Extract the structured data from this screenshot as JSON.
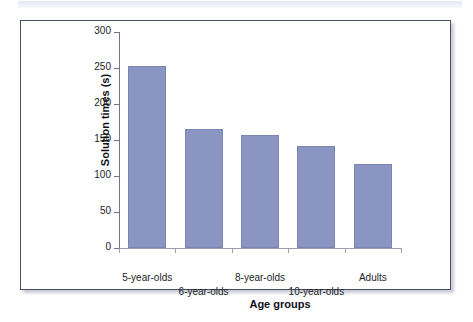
{
  "figure": {
    "background_color": "#ffffff",
    "frame_color": "#4a4f66",
    "top_strip_color": "#e3e7f1"
  },
  "chart_data": {
    "type": "bar",
    "title": "",
    "subtitle": "",
    "xlabel": "Age groups",
    "ylabel": "Solution times (s)",
    "categories": [
      "5-year-olds",
      "6-year-olds",
      "8-year-olds",
      "10-year-olds",
      "Adults"
    ],
    "values": [
      253,
      165,
      157,
      142,
      117
    ],
    "series": [
      {
        "name": "Solution times (s)",
        "values": [
          253,
          165,
          157,
          142,
          117
        ]
      }
    ],
    "ylim": [
      0,
      300
    ],
    "yticks": [
      0,
      50,
      100,
      150,
      200,
      250,
      300
    ],
    "ytick_labels": [
      "0",
      "50",
      "100",
      "150",
      "200",
      "250",
      "300"
    ],
    "xlim_categories": 5,
    "grid": false,
    "legend": false,
    "legend_position": "none",
    "bar_color": "#8b95c2",
    "bar_border_color": "#7b85b4",
    "axis_color": "#70748c",
    "label_stagger": [
      "top",
      "bottom",
      "top",
      "bottom",
      "top"
    ],
    "annotations": []
  }
}
